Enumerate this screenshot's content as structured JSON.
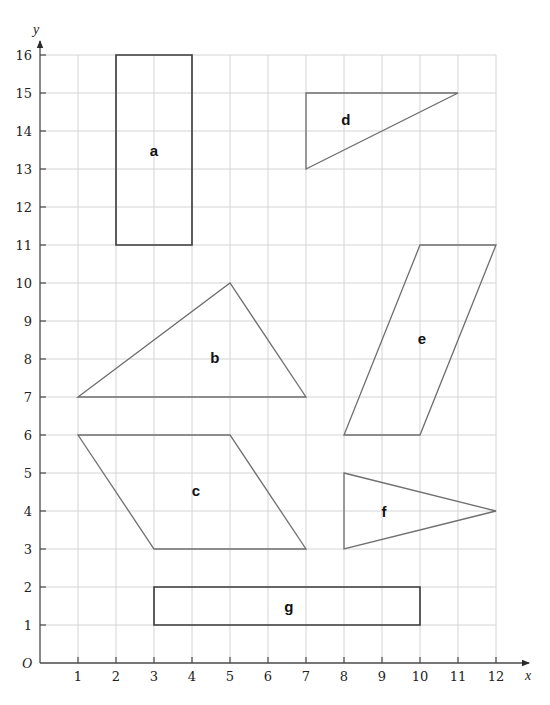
{
  "diagram": {
    "title": "",
    "axes": {
      "x_label": "x",
      "y_label": "y",
      "origin_label": "O",
      "x_ticks": [
        1,
        2,
        3,
        4,
        5,
        6,
        7,
        8,
        9,
        10,
        11,
        12
      ],
      "y_ticks": [
        1,
        2,
        3,
        4,
        5,
        6,
        7,
        8,
        9,
        10,
        11,
        12,
        13,
        14,
        15,
        16
      ],
      "x_range": [
        0,
        12
      ],
      "y_range": [
        0,
        16
      ],
      "grid": true
    },
    "colors": {
      "grid": "#d4d4d4",
      "axis": "#4a4a4a",
      "rectangle_stroke": "#3a3a3a",
      "polygon_stroke": "#6e6e6e",
      "label": "#111111"
    },
    "shapes": [
      {
        "id": "a",
        "label": "a",
        "type": "rectangle",
        "vertices": [
          [
            2,
            11
          ],
          [
            4,
            11
          ],
          [
            4,
            16
          ],
          [
            2,
            16
          ]
        ],
        "label_pos": [
          3,
          13.5
        ],
        "stroke": "#3a3a3a",
        "stroke_width": 1.6
      },
      {
        "id": "b",
        "label": "b",
        "type": "triangle",
        "vertices": [
          [
            1,
            7
          ],
          [
            5,
            10
          ],
          [
            7,
            7
          ]
        ],
        "label_pos": [
          4.6,
          8.05
        ],
        "stroke": "#6e6e6e",
        "stroke_width": 1.3
      },
      {
        "id": "c",
        "label": "c",
        "type": "parallelogram",
        "vertices": [
          [
            1,
            6
          ],
          [
            5,
            6
          ],
          [
            7,
            3
          ],
          [
            3,
            3
          ]
        ],
        "label_pos": [
          4.1,
          4.55
        ],
        "stroke": "#6e6e6e",
        "stroke_width": 1.3
      },
      {
        "id": "d",
        "label": "d",
        "type": "triangle",
        "vertices": [
          [
            7,
            15
          ],
          [
            11,
            15
          ],
          [
            7,
            13
          ]
        ],
        "label_pos": [
          8.05,
          14.3
        ],
        "stroke": "#6e6e6e",
        "stroke_width": 1.3
      },
      {
        "id": "e",
        "label": "e",
        "type": "parallelogram",
        "vertices": [
          [
            8,
            6
          ],
          [
            10,
            6
          ],
          [
            12,
            11
          ],
          [
            10,
            11
          ]
        ],
        "label_pos": [
          10.05,
          8.55
        ],
        "stroke": "#6e6e6e",
        "stroke_width": 1.3
      },
      {
        "id": "f",
        "label": "f",
        "type": "triangle",
        "vertices": [
          [
            8,
            5
          ],
          [
            12,
            4
          ],
          [
            8,
            3
          ]
        ],
        "label_pos": [
          9.05,
          4.0
        ],
        "stroke": "#6e6e6e",
        "stroke_width": 1.3
      },
      {
        "id": "g",
        "label": "g",
        "type": "rectangle",
        "vertices": [
          [
            3,
            1
          ],
          [
            10,
            1
          ],
          [
            10,
            2
          ],
          [
            3,
            2
          ]
        ],
        "label_pos": [
          6.55,
          1.5
        ],
        "stroke": "#3a3a3a",
        "stroke_width": 1.6
      }
    ]
  }
}
